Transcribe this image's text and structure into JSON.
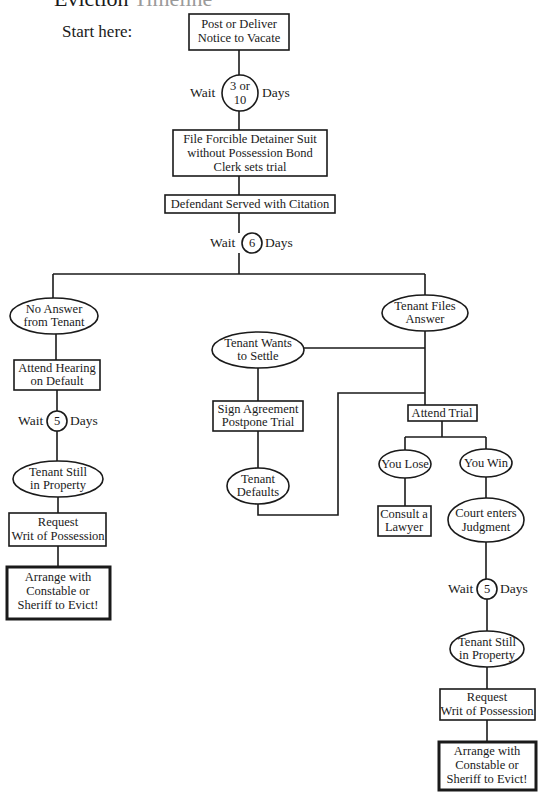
{
  "title": {
    "main": "Eviction",
    "sub": "Timeline"
  },
  "start_label": "Start here:",
  "colors": {
    "ink": "#1a1a1a",
    "background": "#ffffff"
  },
  "nodes": {
    "notice": {
      "shape": "box",
      "lines": [
        "Post or Deliver",
        "Notice to Vacate"
      ]
    },
    "wait1": {
      "shape": "circle",
      "prefix": "Wait",
      "lines": [
        "3 or",
        "10"
      ],
      "suffix": "Days"
    },
    "file_suit": {
      "shape": "box",
      "lines": [
        "File Forcible Detainer Suit",
        "without Possession Bond",
        "Clerk sets trial"
      ]
    },
    "served": {
      "shape": "box",
      "lines": [
        "Defendant Served with Citation"
      ]
    },
    "wait2": {
      "shape": "circle",
      "prefix": "Wait",
      "lines": [
        "6"
      ],
      "suffix": "Days"
    },
    "no_answer": {
      "shape": "ellipse",
      "lines": [
        "No Answer",
        "from Tenant"
      ]
    },
    "files_answer": {
      "shape": "ellipse",
      "lines": [
        "Tenant Files",
        "Answer"
      ]
    },
    "wants_settle": {
      "shape": "ellipse",
      "lines": [
        "Tenant Wants",
        "to Settle"
      ]
    },
    "hearing_default": {
      "shape": "box",
      "lines": [
        "Attend Hearing",
        "on Default"
      ]
    },
    "wait3": {
      "shape": "circle",
      "prefix": "Wait",
      "lines": [
        "5"
      ],
      "suffix": "Days"
    },
    "still_left": {
      "shape": "ellipse",
      "lines": [
        "Tenant Still",
        "in Property"
      ]
    },
    "writ_left": {
      "shape": "box",
      "lines": [
        "Request",
        "Writ of Possession"
      ]
    },
    "evict_left": {
      "shape": "box-bold",
      "lines": [
        "Arrange with",
        "Constable or",
        "Sheriff to Evict!"
      ]
    },
    "sign_agreement": {
      "shape": "box",
      "lines": [
        "Sign Agreement",
        "Postpone Trial"
      ]
    },
    "defaults": {
      "shape": "ellipse",
      "lines": [
        "Tenant",
        "Defaults"
      ]
    },
    "attend_trial": {
      "shape": "box",
      "lines": [
        "Attend Trial"
      ]
    },
    "you_lose": {
      "shape": "ellipse",
      "lines": [
        "You Lose"
      ]
    },
    "you_win": {
      "shape": "ellipse",
      "lines": [
        "You Win"
      ]
    },
    "consult_lawyer": {
      "shape": "box",
      "lines": [
        "Consult a",
        "Lawyer"
      ]
    },
    "judgment": {
      "shape": "ellipse",
      "lines": [
        "Court enters",
        "Judgment"
      ]
    },
    "wait4": {
      "shape": "circle",
      "prefix": "Wait",
      "lines": [
        "5"
      ],
      "suffix": "Days"
    },
    "still_right": {
      "shape": "ellipse",
      "lines": [
        "Tenant Still",
        "in Property"
      ]
    },
    "writ_right": {
      "shape": "box",
      "lines": [
        "Request",
        "Writ of Possession"
      ]
    },
    "evict_right": {
      "shape": "box-bold",
      "lines": [
        "Arrange with",
        "Constable or",
        "Sheriff to Evict!"
      ]
    }
  },
  "edges": [
    [
      "notice",
      "wait1"
    ],
    [
      "wait1",
      "file_suit"
    ],
    [
      "file_suit",
      "served"
    ],
    [
      "served",
      "wait2"
    ],
    [
      "wait2",
      "no_answer"
    ],
    [
      "wait2",
      "files_answer"
    ],
    [
      "no_answer",
      "hearing_default"
    ],
    [
      "hearing_default",
      "wait3"
    ],
    [
      "wait3",
      "still_left"
    ],
    [
      "still_left",
      "writ_left"
    ],
    [
      "writ_left",
      "evict_left"
    ],
    [
      "files_answer",
      "wants_settle"
    ],
    [
      "wants_settle",
      "sign_agreement"
    ],
    [
      "sign_agreement",
      "defaults"
    ],
    [
      "defaults",
      "attend_trial"
    ],
    [
      "files_answer",
      "attend_trial"
    ],
    [
      "attend_trial",
      "you_lose"
    ],
    [
      "attend_trial",
      "you_win"
    ],
    [
      "you_lose",
      "consult_lawyer"
    ],
    [
      "you_win",
      "judgment"
    ],
    [
      "judgment",
      "wait4"
    ],
    [
      "wait4",
      "still_right"
    ],
    [
      "still_right",
      "writ_right"
    ],
    [
      "writ_right",
      "evict_right"
    ]
  ]
}
